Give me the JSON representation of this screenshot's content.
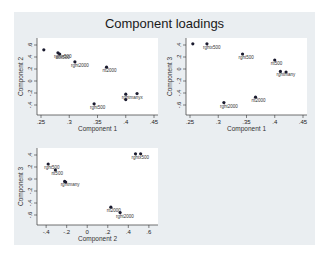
{
  "chart_data": [
    {
      "type": "scatter",
      "title": "Component loadings",
      "xlabel": "Component 1",
      "ylabel": "Component 2",
      "xlim": [
        0.25,
        0.45
      ],
      "ylim": [
        -0.5,
        0.65
      ],
      "xticks": [
        ".25",
        ".3",
        ".35",
        ".4",
        ".45"
      ],
      "yticks": [
        "-.4",
        "-.2",
        "0",
        ".2",
        ".4",
        ".6"
      ],
      "points": [
        {
          "label": "",
          "x": 0.255,
          "y": 0.52
        },
        {
          "label": "rghtx500",
          "x": 0.28,
          "y": 0.47
        },
        {
          "label": "rtot500",
          "x": 0.283,
          "y": 0.45
        },
        {
          "label": "rght2000",
          "x": 0.31,
          "y": 0.32
        },
        {
          "label": "rtt2000",
          "x": 0.366,
          "y": 0.23
        },
        {
          "label": "rght500",
          "x": 0.344,
          "y": -0.38
        },
        {
          "label": "rghtmanyx",
          "x": 0.4,
          "y": -0.22
        },
        {
          "label": "",
          "x": 0.42,
          "y": -0.21
        },
        {
          "label": "",
          "x": 0.4,
          "y": -0.31
        }
      ]
    },
    {
      "type": "scatter",
      "xlabel": "Component 1",
      "ylabel": "Component 3",
      "xlim": [
        0.25,
        0.45
      ],
      "ylim": [
        -0.7,
        0.45
      ],
      "xticks": [
        ".25",
        ".3",
        ".35",
        ".4",
        ".45"
      ],
      "yticks": [
        "-.6",
        "-.4",
        "-.2",
        "0",
        ".2",
        ".4"
      ],
      "points": [
        {
          "label": "",
          "x": 0.255,
          "y": 0.42
        },
        {
          "label": "rghtx500",
          "x": 0.28,
          "y": 0.42
        },
        {
          "label": "rght500",
          "x": 0.343,
          "y": 0.25
        },
        {
          "label": "rtt500",
          "x": 0.4,
          "y": 0.15
        },
        {
          "label": "rghtmany",
          "x": 0.41,
          "y": -0.04
        },
        {
          "label": "",
          "x": 0.42,
          "y": -0.05
        },
        {
          "label": "rtt2000",
          "x": 0.366,
          "y": -0.47
        },
        {
          "label": "rght2000",
          "x": 0.31,
          "y": -0.56
        }
      ]
    },
    {
      "type": "scatter",
      "xlabel": "Component 2",
      "ylabel": "Component 3",
      "xlim": [
        -0.45,
        0.65
      ],
      "ylim": [
        -0.7,
        0.45
      ],
      "xticks": [
        "-.4",
        "-.2",
        "0",
        ".2",
        ".4",
        ".6"
      ],
      "yticks": [
        "-.6",
        "-.4",
        "-.2",
        "0",
        ".2",
        ".4"
      ],
      "points": [
        {
          "label": "rght500",
          "x": -0.38,
          "y": 0.25
        },
        {
          "label": "rtt500",
          "x": -0.31,
          "y": 0.15
        },
        {
          "label": "rghtmany",
          "x": -0.22,
          "y": -0.04
        },
        {
          "label": "",
          "x": -0.21,
          "y": -0.05
        },
        {
          "label": "rghtx500",
          "x": 0.47,
          "y": 0.42
        },
        {
          "label": "",
          "x": 0.52,
          "y": 0.42
        },
        {
          "label": "rtt2000",
          "x": 0.23,
          "y": -0.47
        },
        {
          "label": "rght2000",
          "x": 0.32,
          "y": -0.56
        }
      ]
    }
  ],
  "title": "Component loadings"
}
